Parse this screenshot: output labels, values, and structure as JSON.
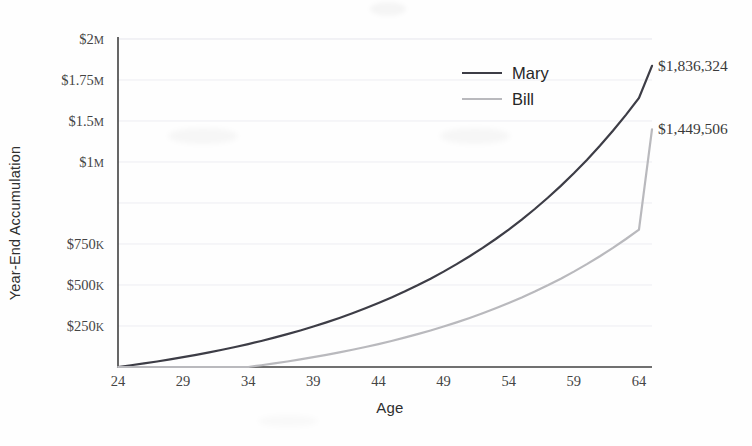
{
  "chart_data": {
    "type": "line",
    "title": "",
    "xlabel": "Age",
    "ylabel": "Year-End Accumulation",
    "x": [
      24,
      25,
      26,
      27,
      28,
      29,
      30,
      31,
      32,
      33,
      34,
      35,
      36,
      37,
      38,
      39,
      40,
      41,
      42,
      43,
      44,
      45,
      46,
      47,
      48,
      49,
      50,
      51,
      52,
      53,
      54,
      55,
      56,
      57,
      58,
      59,
      60,
      61,
      62,
      63,
      64,
      65
    ],
    "xlim": [
      24,
      65
    ],
    "ylim": [
      0,
      2000000
    ],
    "grid": true,
    "legend_position": "upper-right",
    "xtick_labels": [
      "24",
      "29",
      "34",
      "39",
      "44",
      "49",
      "54",
      "59",
      "64"
    ],
    "xtick_values": [
      24,
      29,
      34,
      39,
      44,
      49,
      54,
      59,
      64
    ],
    "ytick_values": [
      250000,
      500000,
      750000,
      1000000,
      1250000,
      1500000,
      1750000,
      2000000
    ],
    "ytick_labels": [
      "$250",
      "$500",
      "$750",
      "$1",
      "$1.5",
      "$1.75",
      "$2"
    ],
    "ytick_label_parts": [
      {
        "value": 2000000,
        "num": "$2",
        "unit": "M"
      },
      {
        "value": 1750000,
        "num": "$1.75",
        "unit": "M"
      },
      {
        "value": 1500000,
        "num": "$1.5",
        "unit": "M"
      },
      {
        "value": 1250000,
        "num": "$1",
        "unit": "M"
      },
      {
        "value": 750000,
        "num": "$750",
        "unit": "K"
      },
      {
        "value": 500000,
        "num": "$500",
        "unit": "K"
      },
      {
        "value": 250000,
        "num": "$250",
        "unit": "K"
      }
    ],
    "series": [
      {
        "name": "Mary",
        "color": "#3d3d46",
        "end_value": 1836324,
        "end_label": "$1,836,324",
        "values": [
          0,
          10600,
          21836,
          33746,
          46371,
          59753,
          73939,
          88975,
          104913,
          121808,
          139717,
          158700,
          178822,
          200151,
          222760,
          246726,
          272129,
          299057,
          327600,
          357856,
          389927,
          423923,
          459958,
          498156,
          538645,
          581564,
          627058,
          675281,
          726398,
          780582,
          838017,
          898898,
          963432,
          1031837,
          1104348,
          1181209,
          1262681,
          1349042,
          1440585,
          1537620,
          1640477,
          1836324
        ]
      },
      {
        "name": "Bill",
        "color": "#b9b9bd",
        "end_value": 1449506,
        "end_label": "$1,449,506",
        "values": [
          0,
          0,
          0,
          0,
          0,
          0,
          0,
          0,
          0,
          0,
          0,
          10600,
          21836,
          33746,
          46371,
          59753,
          73939,
          88975,
          104913,
          121808,
          139717,
          158700,
          178822,
          200151,
          222760,
          246726,
          272129,
          299057,
          327600,
          357856,
          389927,
          423923,
          459958,
          498156,
          538645,
          581564,
          627058,
          675281,
          726398,
          780582,
          838017,
          1449506
        ]
      }
    ]
  },
  "legend": {
    "items": [
      {
        "label": "Mary",
        "color": "#3d3d46"
      },
      {
        "label": "Bill",
        "color": "#b9b9bd"
      }
    ]
  },
  "colors": {
    "mary": "#3d3d46",
    "bill": "#b9b9bd",
    "axis": "#404040",
    "grid": "#ededf2",
    "tick_text": "#454545",
    "title_text": "#2f2f2f",
    "background": "#fefefe"
  }
}
